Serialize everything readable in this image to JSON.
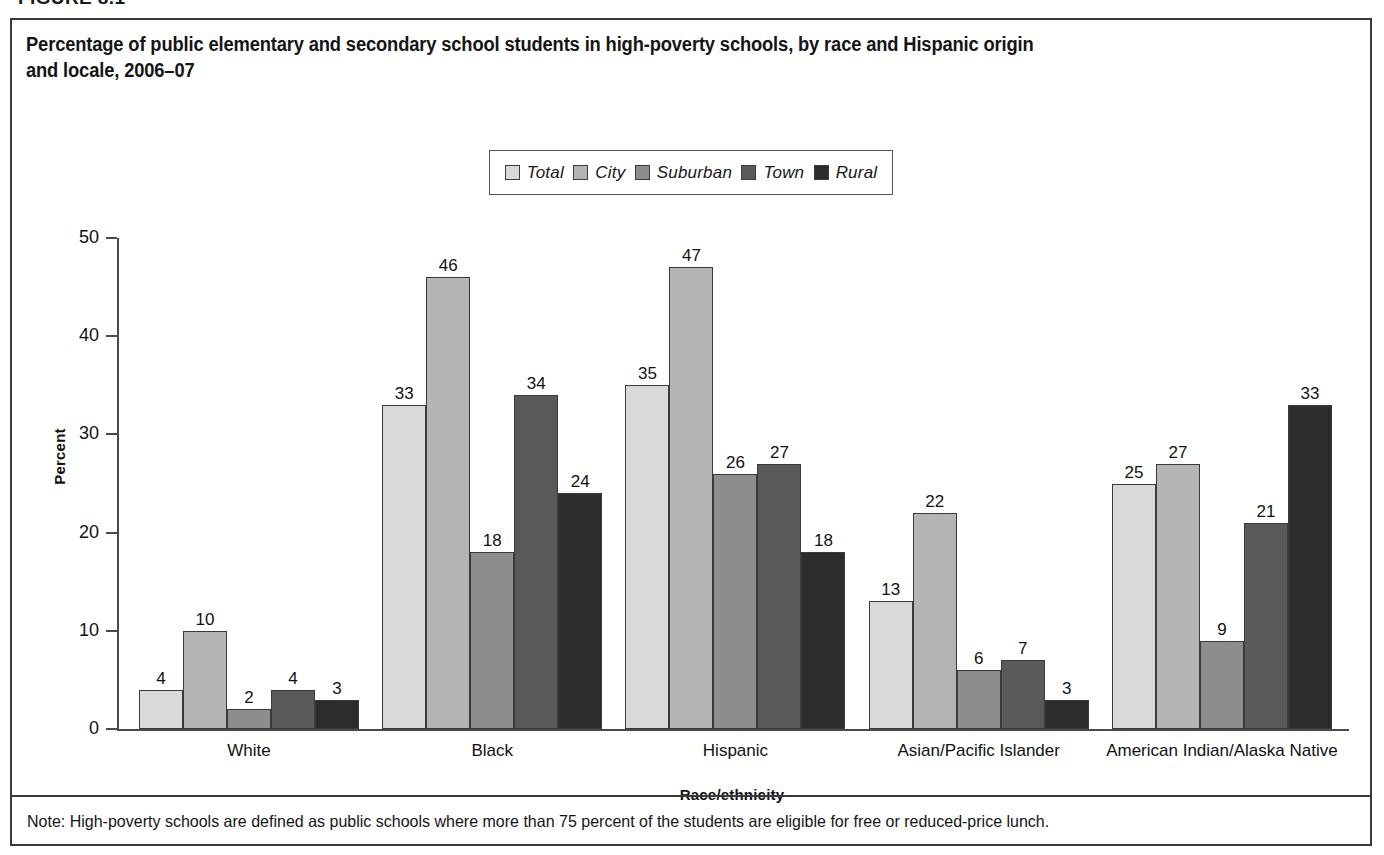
{
  "figure": {
    "number_label": "FIGURE 8.1",
    "title_line1": "Percentage of public elementary and secondary school students in high-poverty schools, by race and Hispanic origin",
    "title_line2": "and locale, 2006–07",
    "note": "Note: High-poverty schools are defined as public schools where more than 75 percent of the students are eligible for free or reduced-price lunch."
  },
  "legend": {
    "items": [
      {
        "label": "Total",
        "color": "#d9d9d9"
      },
      {
        "label": "City",
        "color": "#b4b4b4"
      },
      {
        "label": "Suburban",
        "color": "#8d8d8d"
      },
      {
        "label": "Town",
        "color": "#5a5a5a"
      },
      {
        "label": "Rural",
        "color": "#2c2c2c"
      }
    ]
  },
  "chart_data": {
    "type": "bar",
    "title": "Percentage of public elementary and secondary school students in high-poverty schools, by race and Hispanic origin and locale, 2006–07",
    "xlabel": "Race/ethnicity",
    "ylabel": "Percent",
    "ylim": [
      0,
      50
    ],
    "yticks": [
      0,
      10,
      20,
      30,
      40,
      50
    ],
    "ytick_labels": [
      "0",
      "10",
      "20",
      "30",
      "40",
      "50"
    ],
    "grid": false,
    "legend_position": "top-center",
    "categories": [
      "White",
      "Black",
      "Hispanic",
      "Asian/Pacific Islander",
      "American Indian/Alaska Native"
    ],
    "series": [
      {
        "name": "Total",
        "color": "#d9d9d9",
        "values": [
          4,
          33,
          35,
          13,
          25
        ]
      },
      {
        "name": "City",
        "color": "#b4b4b4",
        "values": [
          10,
          46,
          47,
          22,
          27
        ]
      },
      {
        "name": "Suburban",
        "color": "#8d8d8d",
        "values": [
          2,
          18,
          26,
          6,
          9
        ]
      },
      {
        "name": "Town",
        "color": "#5a5a5a",
        "values": [
          4,
          34,
          27,
          7,
          21
        ]
      },
      {
        "name": "Rural",
        "color": "#2c2c2c",
        "values": [
          3,
          24,
          18,
          3,
          33
        ]
      }
    ]
  }
}
